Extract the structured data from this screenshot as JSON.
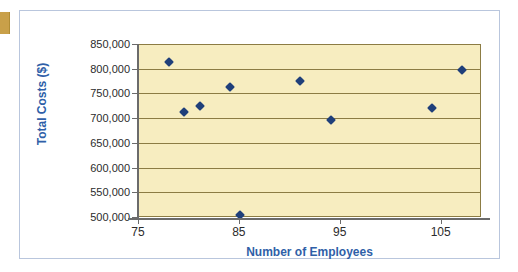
{
  "chart_data": {
    "type": "scatter",
    "title": "",
    "xlabel": "Number of Employees",
    "ylabel": "Total Costs ($)",
    "xlim": [
      75,
      109
    ],
    "ylim": [
      500000,
      850000
    ],
    "xticks": [
      75,
      85,
      95,
      105
    ],
    "xtick_labels": [
      "75",
      "85",
      "95",
      "105"
    ],
    "yticks": [
      500000,
      550000,
      600000,
      650000,
      700000,
      750000,
      800000,
      850000
    ],
    "ytick_labels": [
      "500,000",
      "550,000",
      "600,000",
      "650,000",
      "700,000",
      "750,000",
      "800,000",
      "850,000"
    ],
    "grid": "horizontal",
    "legend": "none",
    "marker_shape": "diamond",
    "marker_color": "#1f3f7a",
    "plot_background": "#f7edc0",
    "axis_label_color": "#2f5fa8",
    "points": [
      {
        "x": 78,
        "y": 815000
      },
      {
        "x": 79.5,
        "y": 714000
      },
      {
        "x": 81,
        "y": 727000
      },
      {
        "x": 84,
        "y": 766000
      },
      {
        "x": 85,
        "y": 506000
      },
      {
        "x": 91,
        "y": 778000
      },
      {
        "x": 94,
        "y": 698000
      },
      {
        "x": 104,
        "y": 723000
      },
      {
        "x": 107,
        "y": 800000
      }
    ]
  }
}
